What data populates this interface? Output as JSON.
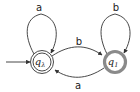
{
  "diagram": {
    "type": "finite-automaton",
    "states": [
      {
        "id": "q_lambda",
        "label": "q",
        "subscript": "λ",
        "initial": true,
        "accepting": true,
        "highlighted": false,
        "cx": 42,
        "cy": 62,
        "r": 11
      },
      {
        "id": "q_1",
        "label": "q",
        "subscript": "1",
        "initial": false,
        "accepting": false,
        "highlighted": true,
        "cx": 115,
        "cy": 62,
        "r": 11
      }
    ],
    "transitions": [
      {
        "from": "q_lambda",
        "to": "q_lambda",
        "symbol": "a"
      },
      {
        "from": "q_1",
        "to": "q_1",
        "symbol": "b"
      },
      {
        "from": "q_lambda",
        "to": "q_1",
        "symbol": "b"
      },
      {
        "from": "q_1",
        "to": "q_lambda",
        "symbol": "a"
      }
    ],
    "colors": {
      "edge": "#333333",
      "highlight": "#8a8a8a",
      "text": "#222222"
    }
  }
}
